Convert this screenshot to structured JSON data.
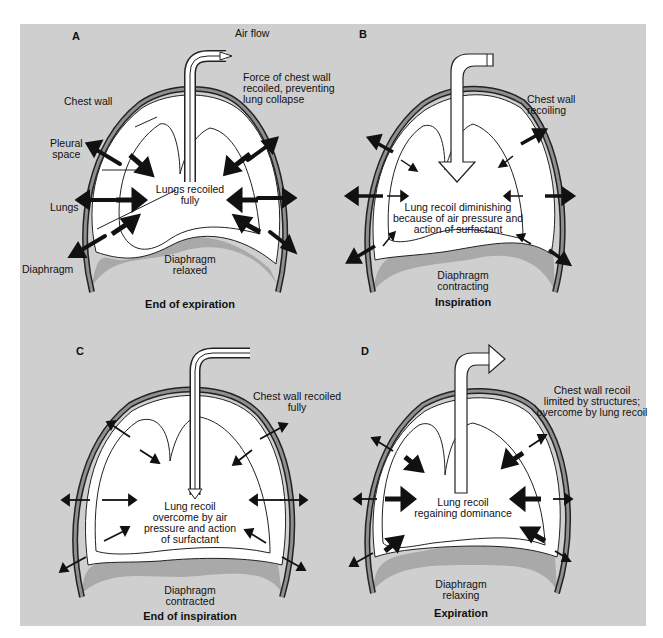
{
  "colors": {
    "background": "#cfcfcf",
    "chest_wall": "#8f8f8f",
    "diaphragm": "#a9a9a9",
    "lung_fill": "#ffffff",
    "ink": "#111111"
  },
  "panels": [
    {
      "letter": "A",
      "caption": "End of expiration",
      "labels": {
        "airflow": "Air flow",
        "chest_wall": "Chest wall",
        "pleural_space": "Pleural\nspace",
        "lungs": "Lungs",
        "diaphragm": "Diaphragm",
        "force_note": "Force of chest wall\nrecoiled, preventing\nlung collapse",
        "center": "Lungs recoiled\nfully",
        "diaphragm_state": "Diaphragm\nrelaxed"
      },
      "tube": "outflow-open",
      "outer_arrows": "large",
      "inner_arrows": "large"
    },
    {
      "letter": "B",
      "caption": "Inspiration",
      "labels": {
        "side_note": "Chest wall\nrecoiling",
        "center": "Lung recoil diminishing\nbecause of air pressure and\naction of surfactant",
        "diaphragm_state": "Diaphragm\ncontracting"
      },
      "tube": "inflow-arrow",
      "outer_arrows": "large",
      "inner_arrows": "small"
    },
    {
      "letter": "C",
      "caption": "End of inspiration",
      "labels": {
        "side_note": "Chest wall recoiled\nfully",
        "center": "Lung recoil\novercome by air\npressure and action\nof surfactant",
        "diaphragm_state": "Diaphragm\ncontracted"
      },
      "tube": "inflow-thin",
      "outer_arrows": "small",
      "inner_arrows": "small"
    },
    {
      "letter": "D",
      "caption": "Expiration",
      "labels": {
        "side_note": "Chest wall recoil\nlimited by structures;\novercome by lung recoil",
        "center": "Lung recoil\nregaining dominance",
        "diaphragm_state": "Diaphragm\nrelaxing"
      },
      "tube": "outflow-arrow",
      "outer_arrows": "small",
      "inner_arrows": "large"
    }
  ]
}
